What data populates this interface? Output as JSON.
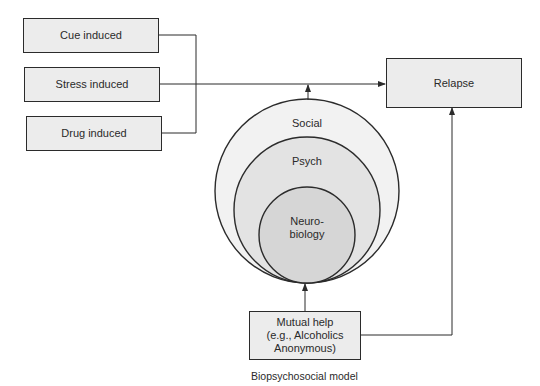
{
  "diagram": {
    "triggers": [
      {
        "label": "Cue induced"
      },
      {
        "label": "Stress induced"
      },
      {
        "label": "Drug induced"
      }
    ],
    "outcome": {
      "label": "Relapse"
    },
    "circles": {
      "outer": {
        "label": "Social"
      },
      "middle": {
        "label": "Psych"
      },
      "inner": {
        "label": "Neuro-\nbiology",
        "line1": "Neuro-",
        "line2": "biology"
      }
    },
    "intervention": {
      "line1": "Mutual help",
      "line2": "(e.g., Alcoholics",
      "line3": "Anonymous)"
    },
    "caption": "Biopsychosocial model",
    "colors": {
      "box_fill": "#ececec",
      "outer_circle": "#f2f2f2",
      "middle_circle": "#e3e3e3",
      "inner_circle": "#d6d6d6",
      "stroke": "#2b2b2b"
    }
  }
}
